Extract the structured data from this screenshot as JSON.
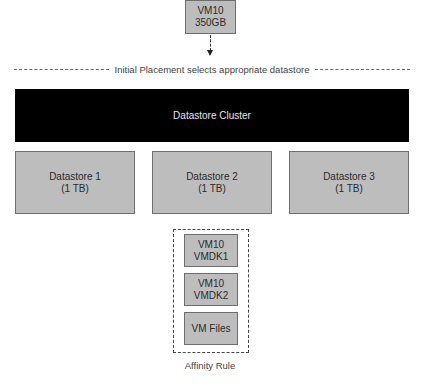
{
  "vm": {
    "line1": "VM10",
    "line2": "350GB"
  },
  "placement_label": "Initial Placement selects appropriate datastore",
  "cluster": {
    "label": "Datastore Cluster"
  },
  "datastores": [
    {
      "name": "Datastore 1",
      "size": "(1 TB)"
    },
    {
      "name": "Datastore 2",
      "size": "(1 TB)"
    },
    {
      "name": "Datastore 3",
      "size": "(1 TB)"
    }
  ],
  "affinity": {
    "items": [
      {
        "line1": "VM10",
        "line2": "VMDK1"
      },
      {
        "line1": "VM10",
        "line2": "VMDK2"
      },
      {
        "line1": "VM Files",
        "line2": ""
      }
    ],
    "label": "Affinity Rule"
  },
  "colors": {
    "box_fill": "#bdbdbd",
    "box_border": "#6e6e6e",
    "cluster_fill": "#000000",
    "cluster_text": "#e6e6e6"
  }
}
